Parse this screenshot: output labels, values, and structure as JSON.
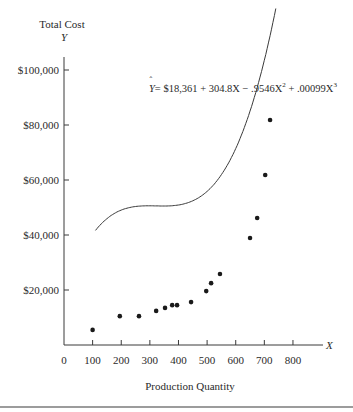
{
  "chart_data": {
    "type": "scatter",
    "title": "",
    "ylabel_top": "Total Cost",
    "yaxis_symbol": "Y",
    "xaxis_symbol": "X",
    "xlabel": "Production Quantity",
    "xlim": [
      0,
      900
    ],
    "ylim": [
      0,
      110000
    ],
    "grid": false,
    "x_ticks": [
      0,
      100,
      200,
      300,
      400,
      500,
      600,
      700,
      800
    ],
    "x_tick_labels": [
      "0",
      "100",
      "200",
      "300",
      "400",
      "500",
      "600",
      "700",
      "800"
    ],
    "y_ticks": [
      20000,
      40000,
      60000,
      80000,
      100000
    ],
    "y_tick_labels": [
      "$20,000",
      "$40,000",
      "$60,000",
      "$80,000",
      "$100,000"
    ],
    "equation": {
      "lhs": "Y",
      "rhs": "= $18,361 + 304.8X − .9546X",
      "sq": "2",
      "plus": " + .00099X",
      "cube": "3"
    },
    "series": [
      {
        "name": "Observed",
        "kind": "points",
        "x": [
          100,
          195,
          262,
          322,
          353,
          378,
          395,
          444,
          497,
          514,
          545,
          650,
          675,
          703,
          720
        ],
        "y": [
          5500,
          10500,
          10500,
          12400,
          13500,
          14500,
          14500,
          15600,
          19600,
          22500,
          25800,
          38900,
          46200,
          61800,
          81800
        ]
      },
      {
        "name": "Fitted cubic",
        "kind": "curve",
        "coefficients": [
          18361,
          304.8,
          -0.9546,
          0.00099
        ],
        "x_range": [
          110,
          740
        ]
      }
    ]
  }
}
